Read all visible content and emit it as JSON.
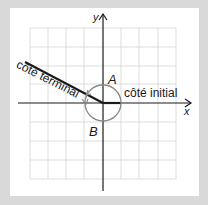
{
  "diagram": {
    "axis_x_label": "x",
    "axis_y_label": "y",
    "initial_side_label": "côté initial",
    "terminal_side_label": "côté terminal",
    "angle_a_label": "A",
    "angle_b_label": "B",
    "colors": {
      "background": "#d9d9d9",
      "panel": "#ffffff",
      "grid": "#d4d4d4",
      "axes": "#1a1a1a",
      "circle": "#888888"
    }
  }
}
